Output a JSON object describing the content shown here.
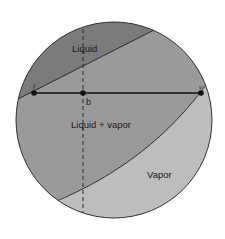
{
  "diagram": {
    "regions": [
      {
        "id": "liquid",
        "label": "Liquid",
        "color": "#7a7a7a"
      },
      {
        "id": "liquid_vapor",
        "label": "Liquid + vapor",
        "color": "#999999"
      },
      {
        "id": "vapor",
        "label": "Vapor",
        "color": "#bdbdbd"
      }
    ],
    "points": [
      {
        "id": "l",
        "label": "l"
      },
      {
        "id": "b",
        "label": "b"
      },
      {
        "id": "v",
        "label": "v"
      }
    ],
    "tie_line": {
      "from": "l",
      "to": "v",
      "through": "b"
    },
    "isopleth": {
      "style": "dashed",
      "through": "b"
    },
    "colors": {
      "outline": "#333333",
      "background": "#ffffff",
      "text": "#1a1a1a"
    }
  }
}
